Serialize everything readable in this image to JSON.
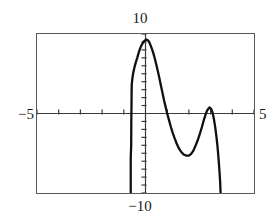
{
  "canvas": {
    "width": 280,
    "height": 224,
    "background": "#ffffff"
  },
  "frame": {
    "x": 36,
    "y": 33,
    "width": 219,
    "height": 161,
    "border_color": "#555a5e"
  },
  "labels": {
    "y_max": "10",
    "y_min": "−10",
    "x_min": "−5",
    "x_max": "5"
  },
  "colors": {
    "curve": "#101010",
    "axis": "#3a3a3a",
    "frame": "#555a5e",
    "text": "#1a1a1a",
    "background": "#ffffff"
  },
  "chart_data": {
    "type": "line",
    "title": "",
    "xlabel": "",
    "ylabel": "",
    "xlim": [
      -5,
      5
    ],
    "ylim": [
      -10,
      10
    ],
    "grid": false,
    "legend": null,
    "x_axis": {
      "position_y_value": 0,
      "tick_values": [
        -5,
        -4,
        -3,
        -2,
        -1,
        0,
        1,
        2,
        3,
        4,
        5
      ],
      "tick_labels": [
        "-5",
        "",
        "",
        "",
        "",
        "",
        "",
        "",
        "",
        "",
        "5"
      ],
      "tick_spacing_value": 1
    },
    "y_axis": {
      "position_x_value": 0,
      "tick_values": [
        -10,
        -9,
        -8,
        -7,
        -6,
        -5,
        -4,
        -3,
        -2,
        -1,
        0,
        1,
        2,
        3,
        4,
        5,
        6,
        7,
        8,
        9,
        10
      ],
      "tick_labels": [
        "-10",
        "",
        "",
        "",
        "",
        "",
        "",
        "",
        "",
        "",
        "",
        "",
        "",
        "",
        "",
        "",
        "",
        "",
        "",
        "",
        "10"
      ],
      "tick_spacing_value": 1
    },
    "features": {
      "main_peak": {
        "x": 0.05,
        "y": 9.2
      },
      "trough": {
        "x": 2.0,
        "y": -5.3
      },
      "secondary_peak": {
        "x": 2.95,
        "y": 0.75
      },
      "left_asymptote_x": -0.62,
      "right_drop_x": 3.45
    },
    "points": [
      [
        -0.68,
        -10.0
      ],
      [
        -0.68,
        -5.6
      ],
      [
        -0.66,
        -4.0
      ],
      [
        -0.655,
        -1.2
      ],
      [
        -0.65,
        0.0
      ],
      [
        -0.645,
        1.1
      ],
      [
        -0.64,
        2.6
      ],
      [
        -0.635,
        3.6
      ],
      [
        -0.6,
        4.5
      ],
      [
        -0.56,
        5.2
      ],
      [
        -0.5,
        5.9
      ],
      [
        -0.44,
        6.5
      ],
      [
        -0.38,
        7.0
      ],
      [
        -0.32,
        7.6
      ],
      [
        -0.26,
        8.1
      ],
      [
        -0.2,
        8.5
      ],
      [
        -0.14,
        8.8
      ],
      [
        -0.08,
        9.05
      ],
      [
        -0.02,
        9.2
      ],
      [
        0.05,
        9.3
      ],
      [
        0.11,
        9.2
      ],
      [
        0.17,
        9.0
      ],
      [
        0.23,
        8.6
      ],
      [
        0.3,
        8.1
      ],
      [
        0.37,
        7.5
      ],
      [
        0.44,
        6.8
      ],
      [
        0.51,
        6.0
      ],
      [
        0.58,
        5.2
      ],
      [
        0.65,
        4.3
      ],
      [
        0.72,
        3.4
      ],
      [
        0.79,
        2.5
      ],
      [
        0.86,
        1.6
      ],
      [
        0.93,
        0.8
      ],
      [
        1.0,
        0.0
      ],
      [
        1.08,
        -0.8
      ],
      [
        1.16,
        -1.6
      ],
      [
        1.25,
        -2.4
      ],
      [
        1.34,
        -3.1
      ],
      [
        1.44,
        -3.8
      ],
      [
        1.54,
        -4.4
      ],
      [
        1.65,
        -4.85
      ],
      [
        1.76,
        -5.15
      ],
      [
        1.88,
        -5.3
      ],
      [
        2.0,
        -5.3
      ],
      [
        2.1,
        -5.1
      ],
      [
        2.2,
        -4.7
      ],
      [
        2.3,
        -4.1
      ],
      [
        2.4,
        -3.4
      ],
      [
        2.5,
        -2.6
      ],
      [
        2.6,
        -1.7
      ],
      [
        2.68,
        -0.9
      ],
      [
        2.76,
        -0.2
      ],
      [
        2.82,
        0.25
      ],
      [
        2.88,
        0.55
      ],
      [
        2.95,
        0.75
      ],
      [
        3.02,
        0.6
      ],
      [
        3.08,
        0.2
      ],
      [
        3.14,
        -0.5
      ],
      [
        3.2,
        -1.5
      ],
      [
        3.26,
        -2.7
      ],
      [
        3.32,
        -4.2
      ],
      [
        3.37,
        -5.8
      ],
      [
        3.41,
        -7.3
      ],
      [
        3.44,
        -8.6
      ],
      [
        3.46,
        -10.0
      ]
    ]
  }
}
